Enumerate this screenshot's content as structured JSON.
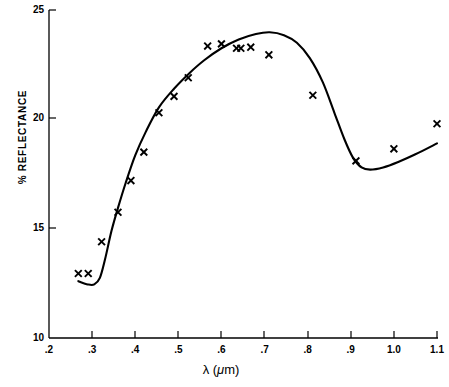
{
  "chart_data": {
    "type": "scatter",
    "title": "",
    "xlabel": "λ (μm)",
    "ylabel": "% REFLECTANCE",
    "xlim": [
      0.2,
      1.1
    ],
    "ylim": [
      10,
      25
    ],
    "xticks": [
      ".2",
      ".3",
      ".4",
      ".5",
      ".6",
      ".7",
      ".8",
      ".9",
      "1.0",
      "1.1"
    ],
    "xtick_values": [
      0.2,
      0.3,
      0.4,
      0.5,
      0.6,
      0.7,
      0.8,
      0.9,
      1.0,
      1.1
    ],
    "yticks": [
      "25",
      "20",
      "15",
      "10"
    ],
    "ytick_values": [
      25,
      20,
      15,
      10
    ],
    "grid": false,
    "legend": "none",
    "marker": "x",
    "series": [
      {
        "name": "measured reflectance",
        "marker": "x",
        "x": [
          0.268,
          0.291,
          0.322,
          0.36,
          0.39,
          0.42,
          0.455,
          0.49,
          0.523,
          0.568,
          0.6,
          0.635,
          0.645,
          0.668,
          0.71,
          0.812,
          0.912,
          1.0,
          1.1
        ],
        "y": [
          12.95,
          12.95,
          14.4,
          15.75,
          17.2,
          18.5,
          20.3,
          21.05,
          21.9,
          23.35,
          23.45,
          23.25,
          23.25,
          23.3,
          22.95,
          21.1,
          18.1,
          18.65,
          19.8
        ]
      },
      {
        "name": "fitted curve",
        "marker": "none",
        "x": [
          0.268,
          0.29,
          0.305,
          0.318,
          0.33,
          0.345,
          0.36,
          0.378,
          0.4,
          0.425,
          0.455,
          0.49,
          0.525,
          0.56,
          0.6,
          0.64,
          0.68,
          0.712,
          0.745,
          0.775,
          0.805,
          0.835,
          0.862,
          0.885,
          0.905,
          0.925,
          0.945,
          0.975,
          1.01,
          1.05,
          1.1
        ],
        "y": [
          12.6,
          12.45,
          12.45,
          12.75,
          13.6,
          14.9,
          15.95,
          17.1,
          18.35,
          19.45,
          20.55,
          21.4,
          22.1,
          22.7,
          23.25,
          23.65,
          23.9,
          23.98,
          23.85,
          23.5,
          22.8,
          21.7,
          20.3,
          19.1,
          18.25,
          17.8,
          17.7,
          17.8,
          18.05,
          18.4,
          18.9
        ]
      }
    ]
  },
  "icons": {
    "marker_glyph": "×"
  },
  "colors": {
    "axis": "#000000",
    "curve": "#000000",
    "marker": "#000000",
    "background": "#ffffff"
  }
}
